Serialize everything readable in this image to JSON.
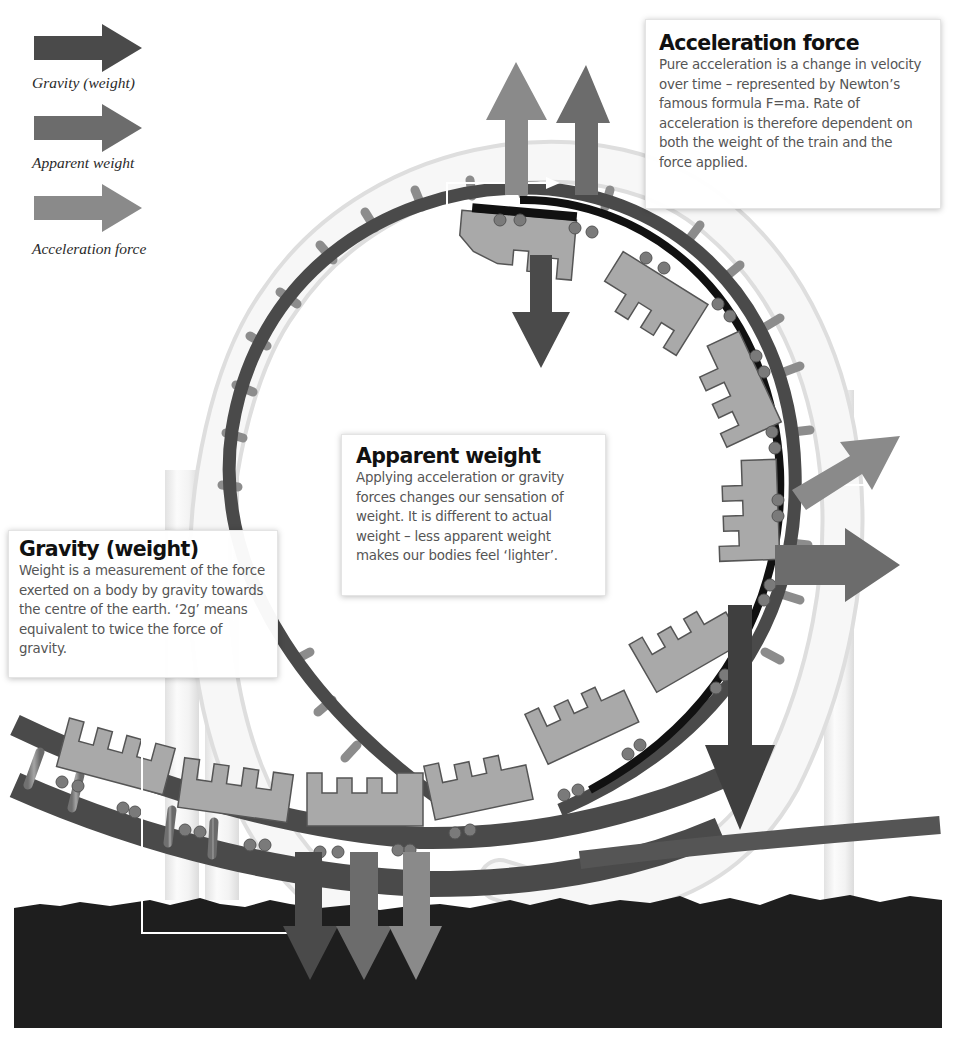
{
  "legend": {
    "items": [
      {
        "label": "Gravity (weight)",
        "color": "#4a4a4a",
        "icon": "arrow-right-icon"
      },
      {
        "label": "Apparent weight",
        "color": "#6c6c6c",
        "icon": "arrow-right-icon"
      },
      {
        "label": "Acceleration force",
        "color": "#8a8a8a",
        "icon": "arrow-right-icon"
      }
    ]
  },
  "callouts": {
    "acceleration": {
      "title": "Acceleration force",
      "body": "Pure acceleration is a change in velocity over time – represented by Newton’s famous formula F=ma. Rate of acceleration is therefore dependent on both the weight of the train and the force applied."
    },
    "apparent": {
      "title": "Apparent weight",
      "body": "Applying acceleration or gravity forces changes our sensation of weight. It is different to actual weight – less apparent weight makes our bodies feel ‘lighter’."
    },
    "gravity": {
      "title": "Gravity (weight)",
      "body": "Weight is a measurement of the force exerted on a body by gravity towards the centre of the earth. ‘2g’ means equivalent to twice the force of gravity."
    }
  },
  "colors": {
    "gravity_arrow": "#4a4a4a",
    "apparent_arrow": "#6c6c6c",
    "acceleration_arrow": "#8a8a8a",
    "track": "#4d4d4d",
    "car_fill": "#a9a9a9",
    "ground": "#1e1e1e",
    "support_tube": "#efefef"
  },
  "diagram": {
    "force_arrows": [
      {
        "type": "acceleration",
        "position": "top",
        "direction": "up"
      },
      {
        "type": "apparent",
        "position": "top",
        "direction": "up"
      },
      {
        "type": "gravity",
        "position": "top",
        "direction": "down"
      },
      {
        "type": "acceleration",
        "position": "right",
        "direction": "up-right"
      },
      {
        "type": "apparent",
        "position": "right",
        "direction": "right"
      },
      {
        "type": "gravity",
        "position": "right",
        "direction": "down"
      },
      {
        "type": "gravity",
        "position": "bottom",
        "direction": "down"
      },
      {
        "type": "apparent",
        "position": "bottom",
        "direction": "down"
      },
      {
        "type": "acceleration",
        "position": "bottom",
        "direction": "down"
      }
    ]
  }
}
